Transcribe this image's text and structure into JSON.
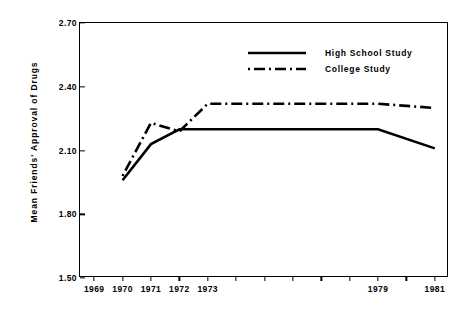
{
  "chart_data": {
    "type": "line",
    "title": "",
    "subtitle": "",
    "xlabel": "",
    "ylabel": "Mean Friends' Approval of Drugs",
    "xlim": [
      1968.5,
      1981.5
    ],
    "ylim": [
      1.5,
      2.7
    ],
    "grid": false,
    "legend_position": "top-right",
    "y_ticks": [
      "2.70",
      "2.40",
      "2.10",
      "1.80",
      "1.50"
    ],
    "y_tick_values": [
      2.7,
      2.4,
      2.1,
      1.8,
      1.5
    ],
    "x_tick_values": [
      1969,
      1970,
      1971,
      1972,
      1973,
      1974,
      1975,
      1976,
      1977,
      1978,
      1979,
      1980,
      1981
    ],
    "x_tick_labels": [
      "1969",
      "1970",
      "1971",
      "1972",
      "1973",
      "",
      "",
      "",
      "",
      "",
      "1979",
      "",
      "1981"
    ],
    "series": [
      {
        "name": "High School Study",
        "style": "solid",
        "x": [
          1970,
          1971,
          1972,
          1973,
          1979,
          1981
        ],
        "values": [
          1.96,
          2.13,
          2.2,
          2.2,
          2.2,
          2.11
        ]
      },
      {
        "name": "College Study",
        "style": "dash-dot",
        "x": [
          1970,
          1971,
          1972,
          1973,
          1979,
          1981
        ],
        "values": [
          1.98,
          2.23,
          2.19,
          2.32,
          2.32,
          2.3
        ]
      }
    ]
  },
  "legend": {
    "items": [
      {
        "label": "High School Study",
        "style": "solid"
      },
      {
        "label": "College Study",
        "style": "dash-dot"
      }
    ]
  },
  "colors": {
    "line": "#000000",
    "axis": "#000000",
    "background": "#ffffff"
  }
}
